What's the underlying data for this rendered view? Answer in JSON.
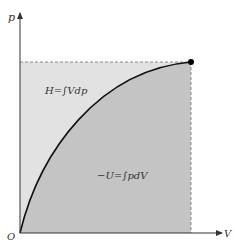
{
  "axes": {
    "y_label": "p",
    "x_label": "V",
    "origin_label": "O"
  },
  "regions": {
    "upper": {
      "label": "H=∫Vdp",
      "color": "#e2e2e2"
    },
    "lower": {
      "label": "−U=∫pdV",
      "color": "#c4c4c4"
    }
  },
  "curve": {
    "color": "#111111"
  },
  "endpoint": {
    "color": "#000000"
  }
}
